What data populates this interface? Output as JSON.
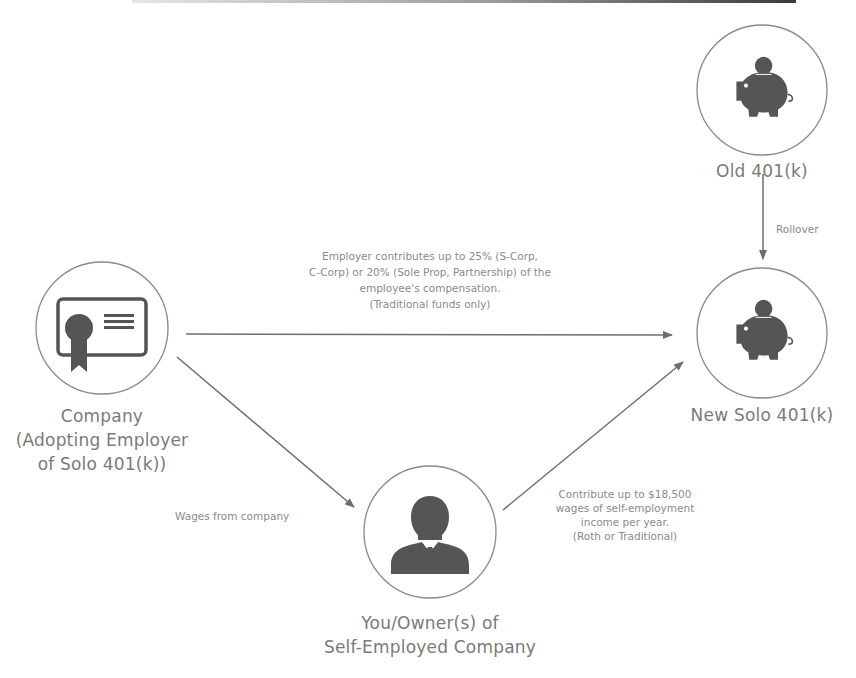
{
  "colors": {
    "icon": "#555555",
    "circle_stroke": "#8a8a8a",
    "arrow": "#6e6e6e",
    "label_text": "#7a7a7a",
    "edge_text": "#8a8a8a"
  },
  "nodes": {
    "old_401k": {
      "label": "Old 401(k)",
      "icon": "piggy-bank-icon"
    },
    "new_solo_401k": {
      "label": "New Solo 401(k)",
      "icon": "piggy-bank-icon"
    },
    "company": {
      "label_lines": [
        "Company",
        "(Adopting Employer",
        "of Solo 401(k))"
      ],
      "icon": "certificate-icon"
    },
    "owner": {
      "label_lines": [
        "You/Owner(s) of",
        "Self-Employed Company"
      ],
      "icon": "businessman-icon"
    }
  },
  "edges": {
    "rollover": {
      "label": "Rollover",
      "from": "old_401k",
      "to": "new_solo_401k"
    },
    "employer_contribution": {
      "from": "company",
      "to": "new_solo_401k",
      "label_lines": [
        "Employer contributes up to 25% (S-Corp,",
        "C-Corp) or 20% (Sole Prop, Partnership) of the",
        "employee's compensation.",
        "(Traditional funds only)"
      ]
    },
    "wages": {
      "label": "Wages from company",
      "from": "company",
      "to": "owner"
    },
    "employee_contribution": {
      "from": "owner",
      "to": "new_solo_401k",
      "label_lines": [
        "Contribute up to $18,500",
        "wages of self-employment",
        "income per year.",
        "(Roth or Traditional)"
      ]
    }
  }
}
